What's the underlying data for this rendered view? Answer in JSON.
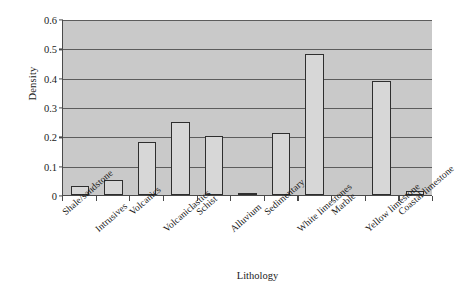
{
  "chart_data": {
    "type": "bar",
    "title": "",
    "xlabel": "Lithology",
    "ylabel": "Density",
    "categories": [
      "Shale/sandstone",
      "Intrusives",
      "Volcanics",
      "Volcaniclastics",
      "Schist",
      "Alluvium",
      "Sedimentary",
      "White limestones",
      "Marble",
      "Yellow limestone",
      "Coastal limestone"
    ],
    "values": [
      0.03,
      0.05,
      0.18,
      0.25,
      0.2,
      0.007,
      0.21,
      0.48,
      0.0,
      0.39,
      0.015
    ],
    "ylim": [
      0,
      0.6
    ],
    "ytick_labels": [
      "0",
      "0.1",
      "0.2",
      "0.3",
      "0.4",
      "0.5",
      "0.6"
    ],
    "ytick_values": [
      0,
      0.1,
      0.2,
      0.3,
      0.4,
      0.5,
      0.6
    ],
    "grid": true,
    "legend": false,
    "bar_fill_color": "#d7d7d7",
    "bar_edge_color": "#2e2e2e",
    "plot_background_color": "#c9c9c9",
    "gridline_color": "#5c5c5c",
    "axis_color": "#4a4a4a",
    "figure_background_color": "#ffffff"
  }
}
